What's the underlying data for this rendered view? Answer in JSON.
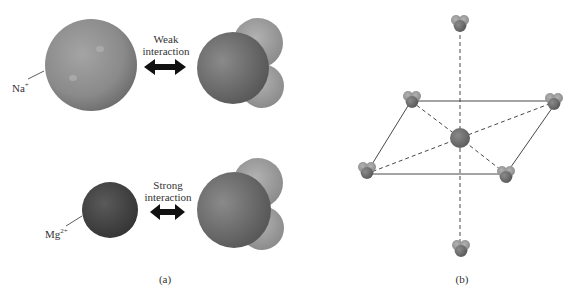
{
  "panel_a": {
    "caption": "(a)",
    "top_row": {
      "ion_label": "Na",
      "ion_charge": "+",
      "interaction_line1": "Weak",
      "interaction_line2": "interaction"
    },
    "bottom_row": {
      "ion_label": "Mg",
      "ion_charge": "2+",
      "interaction_line1": "Strong",
      "interaction_line2": "interaction"
    }
  },
  "panel_b": {
    "caption": "(b)"
  },
  "colors": {
    "na_sphere": "#8e8e8e",
    "mg_sphere": "#4a4a4a",
    "water_oxygen": "#7a7a7a",
    "water_hydrogen": "#a3a3a3",
    "arrow": "#111111"
  }
}
